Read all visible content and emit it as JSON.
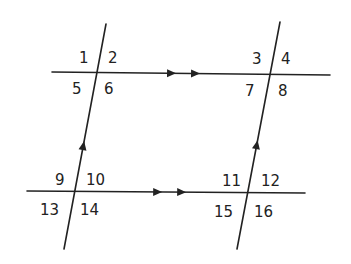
{
  "diagram": {
    "colors": {
      "line": "#222222",
      "text": "#222222",
      "background": "#ffffff"
    },
    "lines": [
      {
        "id": "top-horizontal",
        "x1": 52,
        "y1": 72,
        "x2": 330,
        "y2": 75,
        "marker": "double-arrow"
      },
      {
        "id": "bottom-horizontal",
        "x1": 27,
        "y1": 191,
        "x2": 305,
        "y2": 193,
        "marker": "double-arrow"
      },
      {
        "id": "left-transversal",
        "x1": 106,
        "y1": 24,
        "x2": 64,
        "y2": 249,
        "marker": "single-arrow"
      },
      {
        "id": "right-transversal",
        "x1": 280,
        "y1": 22,
        "x2": 237,
        "y2": 249,
        "marker": "single-arrow"
      }
    ],
    "angle_labels": [
      {
        "text": "1",
        "x": 79,
        "y": 63
      },
      {
        "text": "2",
        "x": 108,
        "y": 63
      },
      {
        "text": "5",
        "x": 72,
        "y": 94
      },
      {
        "text": "6",
        "x": 104,
        "y": 94
      },
      {
        "text": "3",
        "x": 252,
        "y": 64
      },
      {
        "text": "4",
        "x": 281,
        "y": 64
      },
      {
        "text": "7",
        "x": 245,
        "y": 96
      },
      {
        "text": "8",
        "x": 278,
        "y": 96
      },
      {
        "text": "9",
        "x": 55,
        "y": 185
      },
      {
        "text": "10",
        "x": 86,
        "y": 185
      },
      {
        "text": "13",
        "x": 40,
        "y": 215
      },
      {
        "text": "14",
        "x": 80,
        "y": 215
      },
      {
        "text": "11",
        "x": 222,
        "y": 186
      },
      {
        "text": "12",
        "x": 261,
        "y": 186
      },
      {
        "text": "15",
        "x": 214,
        "y": 217
      },
      {
        "text": "16",
        "x": 254,
        "y": 217
      }
    ]
  }
}
